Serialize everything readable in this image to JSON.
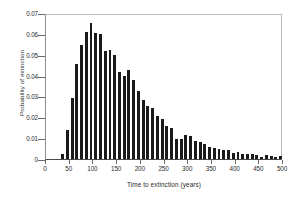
{
  "chart_data": {
    "type": "bar",
    "title": "",
    "xlabel": "Time to extinction (years)",
    "ylabel": "Probability of extinction",
    "xlim": [
      0,
      500
    ],
    "ylim": [
      0,
      0.07
    ],
    "xticks": [
      0,
      50,
      100,
      150,
      200,
      250,
      300,
      350,
      400,
      450,
      500
    ],
    "xtick_labels": [
      "0",
      "50",
      "100",
      "150",
      "200",
      "250",
      "300",
      "350",
      "400",
      "450",
      "500"
    ],
    "yticks": [
      0,
      0.01,
      0.02,
      0.03,
      0.04,
      0.05,
      0.06,
      0.07
    ],
    "ytick_labels": [
      "0",
      "0.01",
      "0.02",
      "0.03",
      "0.04",
      "0.05",
      "0.06",
      "0.07"
    ],
    "grid": false,
    "legend": false,
    "bar_color": "#1a1a1a",
    "bin_width": 10,
    "categories": [
      30,
      40,
      50,
      60,
      70,
      80,
      90,
      100,
      110,
      120,
      130,
      140,
      150,
      160,
      170,
      180,
      190,
      200,
      210,
      220,
      230,
      240,
      250,
      260,
      270,
      280,
      290,
      300,
      310,
      320,
      330,
      340,
      350,
      360,
      370,
      380,
      390,
      400,
      410,
      420,
      430,
      440,
      450,
      460,
      470,
      480,
      490
    ],
    "values": [
      0.0025,
      0.0138,
      0.0292,
      0.0455,
      0.0545,
      0.0608,
      0.065,
      0.0605,
      0.06,
      0.052,
      0.0525,
      0.05,
      0.0415,
      0.04,
      0.0425,
      0.0378,
      0.0328,
      0.0282,
      0.0255,
      0.0245,
      0.0205,
      0.0192,
      0.0158,
      0.015,
      0.0095,
      0.0098,
      0.0115,
      0.0108,
      0.0088,
      0.0082,
      0.0072,
      0.006,
      0.0053,
      0.005,
      0.0042,
      0.0045,
      0.003,
      0.0032,
      0.0025,
      0.0022,
      0.0022,
      0.002,
      0.0012,
      0.0018,
      0.0013,
      0.0012,
      0.0015
    ]
  }
}
